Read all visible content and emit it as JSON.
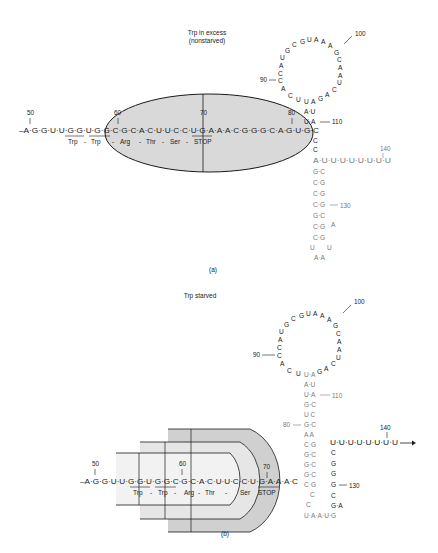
{
  "panel_a": {
    "title_line1": "Trp in excess",
    "title_line2": "(nonstarved)",
    "caption": "(a)",
    "leader_sequence": "–A·G·G·U·U·G·G·U·G·G·C·G·C·A·C·U·U·C·C·U·G·A·A·A·C·G·G·G·C·A·G·U·G·C",
    "codons": [
      "Trp",
      "-",
      "Trp",
      "-",
      "Arg",
      "-",
      "Thr",
      "-",
      "Ser",
      "-",
      "STOP"
    ],
    "numbers": [
      "50",
      "60",
      "70",
      "80",
      "90",
      "100",
      "110",
      "130",
      "140"
    ],
    "loop_sequence": "C·U·U·A·C·C·A·U·G·C·G·U·A·A·A·G·C·A·A·U·C·A·G·A",
    "terminator_tail": "A·U·U·U·U·U·U·U·U",
    "ribosome": "ellipse covering nt 58–84"
  },
  "panel_b": {
    "title": "Trp starved",
    "caption": "(b)",
    "leader_sequence": "–A·G·G·U·U·G·G·U·G·G·C·G·C·A·C·U·U·C·C·U·G·A·A·A·C",
    "codons": [
      "Trp",
      "-",
      "Trp",
      "-",
      "Arg",
      "-",
      "Thr",
      "-",
      "Ser",
      "STOP"
    ],
    "numbers": [
      "50",
      "60",
      "70",
      "80",
      "90",
      "100",
      "110",
      "130",
      "140"
    ],
    "tail": "U·U·U·U·U·U·U·U",
    "ribosome": "stalled ribosomes at Trp codons"
  },
  "colors": {
    "ink": "#1a1a1a",
    "gray_ink": "#7a7a7a",
    "ribosome_light": "#ebebeb",
    "ribosome_dark": "#cfcfcf"
  }
}
